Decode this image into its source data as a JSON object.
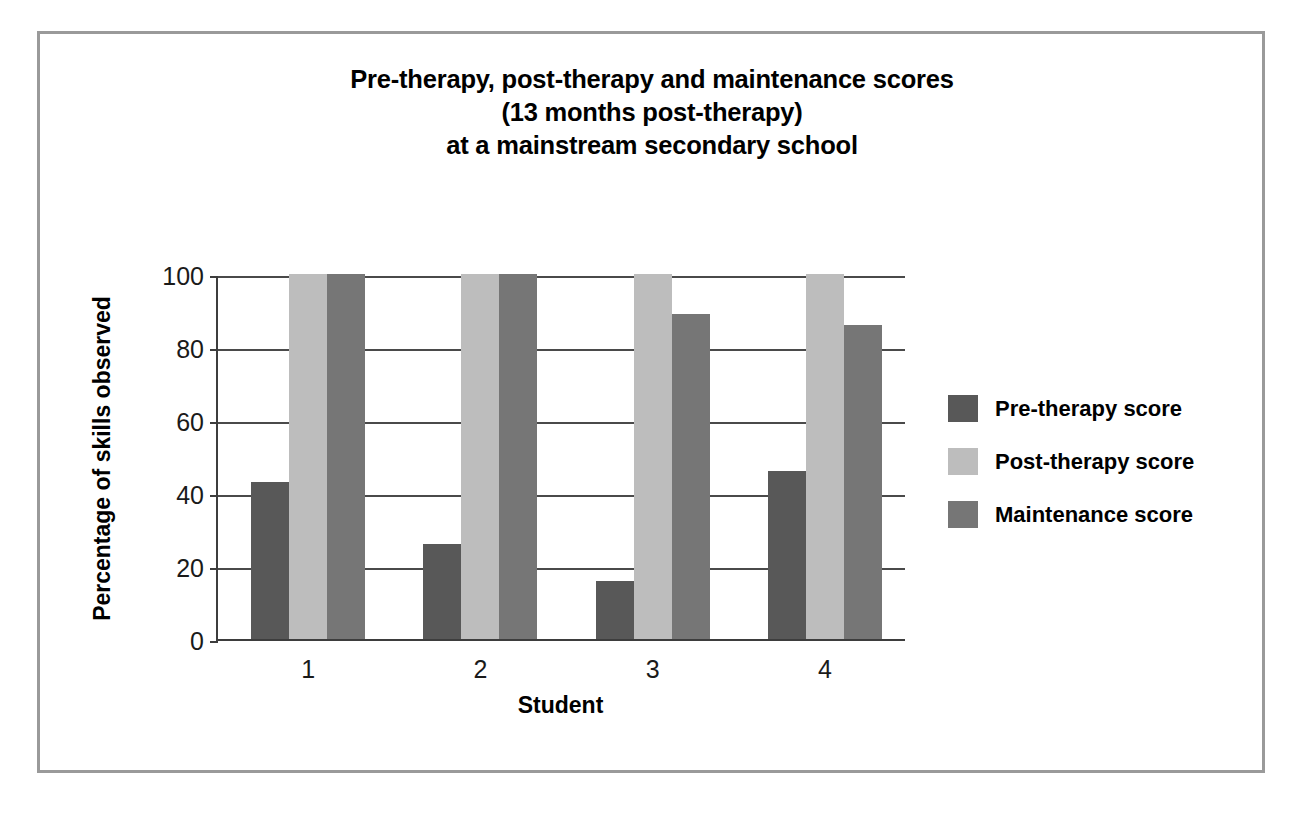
{
  "chart_data": {
    "type": "bar",
    "title": "Pre-therapy, post-therapy and maintenance scores (13 months post-therapy) at a mainstream secondary school",
    "title_lines": [
      "Pre-therapy, post-therapy and maintenance scores",
      "(13 months post-therapy)",
      "at a mainstream secondary school"
    ],
    "xlabel": "Student",
    "ylabel": "Percentage of skills observed",
    "categories": [
      "1",
      "2",
      "3",
      "4"
    ],
    "ylim": [
      0,
      100
    ],
    "yticks": [
      0,
      20,
      40,
      60,
      80,
      100
    ],
    "ytick_labels": [
      "0",
      "20",
      "40",
      "60",
      "80",
      "100"
    ],
    "grid": true,
    "legend_position": "right",
    "series": [
      {
        "name": "Pre-therapy score",
        "color": "#585858",
        "values": [
          43,
          26,
          16,
          46
        ]
      },
      {
        "name": "Post-therapy score",
        "color": "#bdbdbd",
        "values": [
          100,
          100,
          100,
          100
        ]
      },
      {
        "name": "Maintenance score",
        "color": "#767676",
        "values": [
          100,
          100,
          89,
          86
        ]
      }
    ]
  },
  "frame": {
    "border_color": "#9a9a9a"
  }
}
